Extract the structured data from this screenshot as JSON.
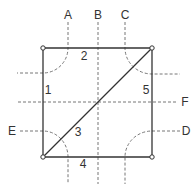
{
  "diagram": {
    "type": "square-with-diagonal-and-dashed-routes",
    "colors": {
      "solid_line": "#333333",
      "dashed_line": "#777777",
      "text": "#333333",
      "node_fill": "#ffffff"
    },
    "square": {
      "corners": [
        {
          "id": "top-left",
          "x": 43,
          "y": 48
        },
        {
          "id": "top-right",
          "x": 152,
          "y": 48
        },
        {
          "id": "bottom-right",
          "x": 152,
          "y": 157
        },
        {
          "id": "bottom-left",
          "x": 43,
          "y": 157
        }
      ]
    },
    "edges": [
      {
        "label": "1",
        "side": "left"
      },
      {
        "label": "2",
        "side": "top"
      },
      {
        "label": "3",
        "side": "diagonal"
      },
      {
        "label": "4",
        "side": "bottom"
      },
      {
        "label": "5",
        "side": "right"
      }
    ],
    "dashed_lines": [
      {
        "label": "A",
        "route": "top to left, curving around top-left corner"
      },
      {
        "label": "B",
        "route": "vertical through center"
      },
      {
        "label": "C",
        "route": "top to right, curving around top-right corner"
      },
      {
        "label": "D",
        "route": "right to bottom, curving around bottom-right corner"
      },
      {
        "label": "E",
        "route": "left to bottom, curving around bottom-left corner"
      },
      {
        "label": "F",
        "route": "horizontal through center"
      }
    ],
    "labels": {
      "A": "A",
      "B": "B",
      "C": "C",
      "D": "D",
      "E": "E",
      "F": "F",
      "edge1": "1",
      "edge2": "2",
      "edge3": "3",
      "edge4": "4",
      "edge5": "5"
    }
  }
}
